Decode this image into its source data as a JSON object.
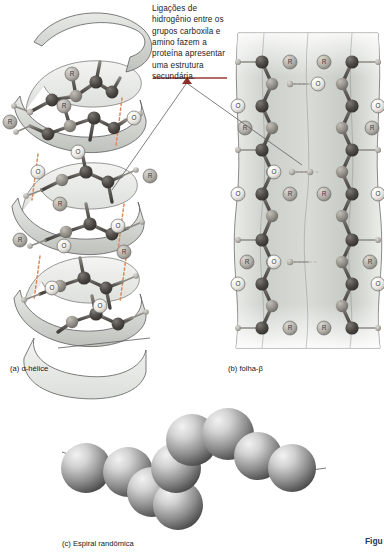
{
  "figure": {
    "annotation": "Ligações de hidrogênio entre os grupos carboxila e amino fazem a proteína apresentar uma estrutura secundária.",
    "figure_ref": "Figu",
    "rule_color": "#9c3b33",
    "panels": [
      {
        "id": "a",
        "label": "(a) α-hélice",
        "structure": "alpha-helix"
      },
      {
        "id": "b",
        "label": "(b) folha-β",
        "structure": "beta-sheet"
      },
      {
        "id": "c",
        "label": "(c) Espiral randômica",
        "structure": "random-coil"
      }
    ],
    "atom_labels": {
      "side_chain": "R",
      "nitrogen": "N",
      "oxygen": "O"
    },
    "colors": {
      "carbon": "#4a4744",
      "nitrogen": "#8e8b86",
      "oxygen": "#e8e6e1",
      "ribbon": "#cfd2cc",
      "sheet": "#c8ccc6",
      "hydrogen_bond": "#e08a5a",
      "sphere": "#9a9a9a",
      "leader": "#6b6b6b"
    }
  }
}
